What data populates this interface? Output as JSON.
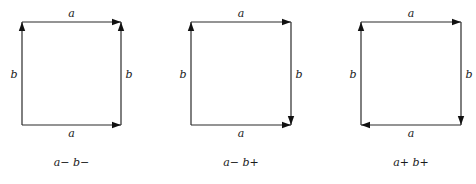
{
  "diagrams": [
    {
      "id": "a-minus-b-minus",
      "caption": "a− b−",
      "box": {
        "x1": 22,
        "y1": 22,
        "x2": 121,
        "y2": 125
      },
      "edges": {
        "top": {
          "label": "a",
          "direction": "right"
        },
        "bottom": {
          "label": "a",
          "direction": "right"
        },
        "left": {
          "label": "b",
          "direction": "up"
        },
        "right": {
          "label": "b",
          "direction": "up"
        }
      }
    },
    {
      "id": "a-minus-b-plus",
      "caption": "a− b+",
      "box": {
        "x1": 191,
        "y1": 22,
        "x2": 291,
        "y2": 125
      },
      "edges": {
        "top": {
          "label": "a",
          "direction": "right"
        },
        "bottom": {
          "label": "a",
          "direction": "right"
        },
        "left": {
          "label": "b",
          "direction": "up"
        },
        "right": {
          "label": "b",
          "direction": "down"
        }
      }
    },
    {
      "id": "a-plus-b-plus",
      "caption": "a+ b+",
      "box": {
        "x1": 361,
        "y1": 22,
        "x2": 461,
        "y2": 125
      },
      "edges": {
        "top": {
          "label": "a",
          "direction": "right"
        },
        "bottom": {
          "label": "a",
          "direction": "left"
        },
        "left": {
          "label": "b",
          "direction": "up"
        },
        "right": {
          "label": "b",
          "direction": "down"
        }
      }
    }
  ],
  "colors": {
    "line": "#2a2a2a",
    "arrowhead": "#111111",
    "text": "#1a1a1a",
    "background": "#ffffff"
  }
}
